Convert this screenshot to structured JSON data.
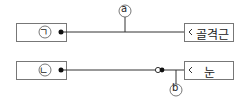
{
  "diagram": {
    "top_row": {
      "left_label": "ㄱ",
      "right_label": "골격근",
      "marker": "a"
    },
    "bottom_row": {
      "left_label": "ㄴ",
      "right_label": "눈",
      "marker": "b"
    },
    "colors": {
      "line": "#333333",
      "box_border": "#777777"
    }
  }
}
